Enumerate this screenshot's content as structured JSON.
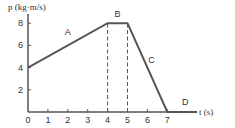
{
  "chart_data": {
    "type": "line",
    "title": "",
    "xlabel": "t (s)",
    "ylabel": "p (kg·m/s)",
    "xlim": [
      0,
      8.5
    ],
    "ylim": [
      0,
      8.5
    ],
    "x_ticks": [
      "0",
      "1",
      "2",
      "3",
      "4",
      "5",
      "6",
      "7"
    ],
    "y_ticks": [
      "2",
      "4",
      "6",
      "8"
    ],
    "grid": false,
    "series": [
      {
        "name": "momentum",
        "x": [
          0,
          4,
          5,
          7,
          8.5
        ],
        "y": [
          4,
          8,
          8,
          0,
          0
        ]
      }
    ],
    "segment_labels": [
      {
        "label": "A",
        "x": 2.0,
        "y": 6.9
      },
      {
        "label": "B",
        "x": 4.5,
        "y": 8.6
      },
      {
        "label": "C",
        "x": 6.2,
        "y": 4.4
      },
      {
        "label": "D",
        "x": 7.9,
        "y": 0.6
      }
    ],
    "reference_lines": [
      {
        "type": "vertical-dashed",
        "x": 4,
        "y_from": 0,
        "y_to": 8
      },
      {
        "type": "vertical-dashed",
        "x": 5,
        "y_from": 0,
        "y_to": 8
      }
    ],
    "colors": {
      "line": "#555555",
      "axis": "#555555",
      "text": "#333333"
    }
  }
}
